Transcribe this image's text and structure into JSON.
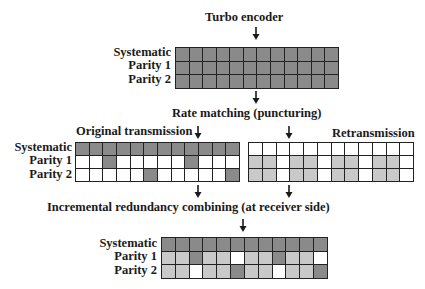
{
  "title": "Turbo encoder",
  "step_rate_matching": "Rate matching (puncturing)",
  "original_label": "Original transmission",
  "retransmission_label": "Retransmission",
  "step_combining": "Incremental redundancy combining (at receiver side)",
  "row_labels": [
    "Systematic",
    "Parity 1",
    "Parity 2"
  ],
  "colors": {
    "dark": "#8a8a8a",
    "light": "#c9c9c9",
    "white": "#ffffff",
    "border": "#222222"
  },
  "legend_codes": {
    "D": "transmitted bit (dark)",
    "L": "retransmitted bit (light gray)",
    "W": "punctured / not sent (white)"
  },
  "grids": {
    "encoder": [
      [
        "D",
        "D",
        "D",
        "D",
        "D",
        "D",
        "D",
        "D",
        "D",
        "D",
        "D",
        "D"
      ],
      [
        "D",
        "D",
        "D",
        "D",
        "D",
        "D",
        "D",
        "D",
        "D",
        "D",
        "D",
        "D"
      ],
      [
        "D",
        "D",
        "D",
        "D",
        "D",
        "D",
        "D",
        "D",
        "D",
        "D",
        "D",
        "D"
      ]
    ],
    "original": [
      [
        "D",
        "D",
        "D",
        "D",
        "D",
        "D",
        "D",
        "D",
        "D",
        "D",
        "D",
        "D"
      ],
      [
        "W",
        "W",
        "D",
        "W",
        "W",
        "W",
        "W",
        "W",
        "D",
        "W",
        "W",
        "W"
      ],
      [
        "W",
        "W",
        "W",
        "W",
        "W",
        "D",
        "W",
        "W",
        "W",
        "W",
        "W",
        "D"
      ]
    ],
    "retransmission": [
      [
        "W",
        "W",
        "W",
        "W",
        "W",
        "W",
        "W",
        "W",
        "W",
        "W",
        "W",
        "W"
      ],
      [
        "L",
        "L",
        "W",
        "L",
        "L",
        "W",
        "L",
        "L",
        "W",
        "L",
        "L",
        "W"
      ],
      [
        "L",
        "L",
        "W",
        "L",
        "L",
        "W",
        "L",
        "L",
        "W",
        "L",
        "L",
        "W"
      ]
    ],
    "combined": [
      [
        "D",
        "D",
        "D",
        "D",
        "D",
        "D",
        "D",
        "D",
        "D",
        "D",
        "D",
        "D"
      ],
      [
        "L",
        "L",
        "D",
        "L",
        "L",
        "W",
        "L",
        "L",
        "D",
        "L",
        "L",
        "W"
      ],
      [
        "L",
        "L",
        "W",
        "L",
        "L",
        "D",
        "L",
        "L",
        "W",
        "L",
        "L",
        "D"
      ]
    ]
  }
}
